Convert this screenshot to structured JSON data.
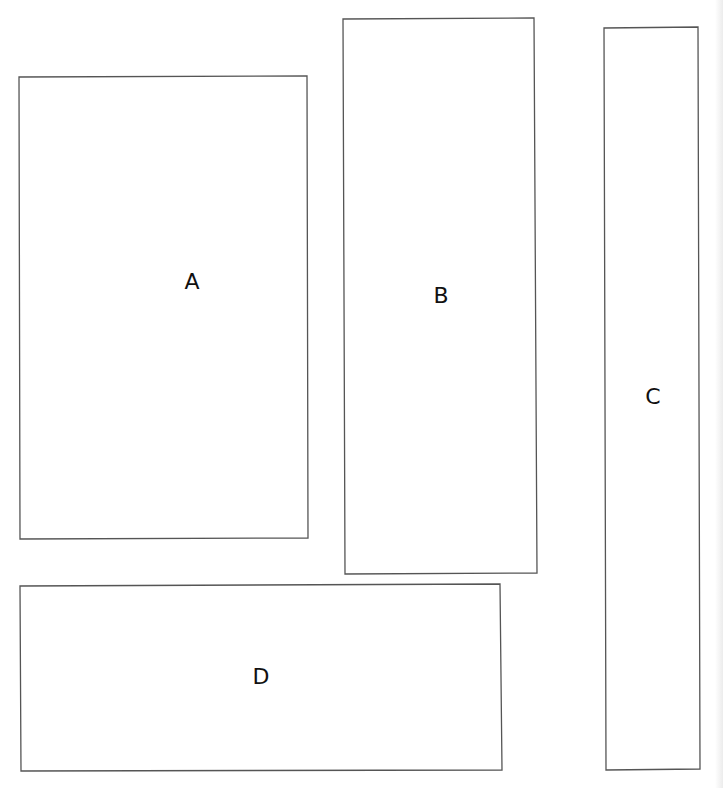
{
  "diagram": {
    "background": "#ffffff",
    "stroke_color": "#555555",
    "shapes": [
      {
        "id": "A",
        "label": "A",
        "points": "19,77 307,76 308,538 20,539",
        "label_x": 192,
        "label_y": 282
      },
      {
        "id": "B",
        "label": "B",
        "points": "343,19 534,18 537,573 345,574",
        "label_x": 441,
        "label_y": 296
      },
      {
        "id": "C",
        "label": "C",
        "points": "604,28 698,27 700,769 606,770",
        "label_x": 653,
        "label_y": 397
      },
      {
        "id": "D",
        "label": "D",
        "points": "20,586 500,584 502,770 21,771",
        "label_x": 261,
        "label_y": 677
      }
    ]
  }
}
